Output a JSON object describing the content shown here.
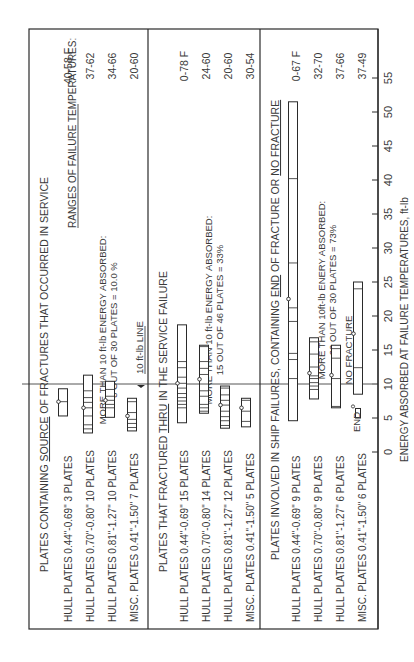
{
  "chart_data": {
    "type": "bar",
    "orientation": "rotated-90-ccw",
    "xlabel": "ENERGY ABSORBED AT FAILURE TEMPERATURES, ft-lb",
    "xlim": [
      0,
      55
    ],
    "xticks": [
      0,
      5,
      10,
      15,
      20,
      25,
      30,
      35,
      40,
      45,
      50,
      55
    ],
    "reference_line": {
      "value": 10,
      "label": "10 ft-lb LINE"
    },
    "ranges_header": "RANGES OF FAILURE TEMPERATURES:",
    "sections": [
      {
        "title_pre": "PLATES CONTAINING ",
        "title_em": "SOURCE",
        "title_post": " OF FRACTURES THAT OCCURRED IN SERVICE",
        "note_line1": "MORE THAN 10 ft-lb ENERGY ABSORBED:",
        "note_line2": "3 OUT OF 30 PLATES = 10.0 %",
        "rows": [
          {
            "label": "HULL PLATES 0.44\"-0.69\"  3 PLATES",
            "min": 5.3,
            "max": 9.3,
            "marker": 7.4,
            "ticks": [
              7.4
            ],
            "temp_range": "40-58 F"
          },
          {
            "label": "HULL PLATES 0.70\"-0.80\"  10 PLATES",
            "min": 2.8,
            "max": 11.3,
            "marker": 6.5,
            "ticks": [
              3.4,
              4.0,
              5.3,
              6.5,
              7.3,
              8.0,
              9.0
            ],
            "temp_range": "37-62"
          },
          {
            "label": "HULL PLATES 0.81\"-1.27\"  10 PLATES",
            "min": 5.1,
            "max": 10.4,
            "marker": 7.6,
            "ticks": [
              6.5,
              7.0,
              7.6,
              8.2,
              9.2
            ],
            "temp_range": "34-66"
          },
          {
            "label": "MISC. PLATES 0.41\"-1.50\"  7 PLATES",
            "min": 3.1,
            "max": 7.9,
            "marker": 5.3,
            "ticks": [
              3.6,
              4.2,
              4.8,
              5.8,
              7.4
            ],
            "temp_range": "20-60"
          }
        ]
      },
      {
        "title_pre": "PLATES THAT FRACTURED ",
        "title_em": "THRU",
        "title_post": " IN THE SERVICE FAILURE",
        "note_line1": "MORE THAN 10 ft-lb ENERGY ABSORBED:",
        "note_line2": "15 OUT OF 46 PLATES = 33%",
        "rows": [
          {
            "label": "HULL PLATES 0.44\"-0.69\"  15 PLATES",
            "min": 4.3,
            "max": 18.7,
            "marker": 10.1,
            "ticks": [
              6.5,
              7.0,
              7.5,
              8.0,
              8.6,
              9.4,
              10.1,
              11.0,
              12.4,
              13.3
            ],
            "temp_range": "0-78 F"
          },
          {
            "label": "HULL PLATES 0.70\"-0.80\"  14 PLATES",
            "min": 5.7,
            "max": 15.7,
            "marker": 10.7,
            "ticks": [
              6.0,
              6.5,
              7.0,
              8.2,
              9.0,
              10.0,
              11.4,
              12.3,
              13.3,
              15.5
            ],
            "temp_range": "24-60"
          },
          {
            "label": "HULL PLATES 0.81\"-1.27\"  12 PLATES",
            "min": 3.5,
            "max": 9.7,
            "marker": 6.9,
            "ticks": [
              3.9,
              4.6,
              5.2,
              6.0,
              6.9,
              7.6,
              8.4,
              9.4
            ],
            "temp_range": "20-60"
          },
          {
            "label": "MISC. PLATES 0.41\"-1.50\"  5 PLATES",
            "min": 3.7,
            "max": 7.9,
            "marker": 6.5,
            "ticks": [
              4.5,
              6.0,
              7.6
            ],
            "temp_range": "30-54"
          }
        ]
      },
      {
        "title_pre": "PLATES INVOLVED IN SHIP FAILURES, CONTAINING ",
        "title_em": "END",
        "title_post": " OF FRACTURE OR ",
        "title_em2": "NO FRACTURE",
        "note_line1": "MORE THAN 10ft-lb ENERY ABSORBED:",
        "note_line2": "22 OUT OF 30 PLATES = 73%",
        "no_fracture_label": "NO FRACTURE",
        "end_label": "END",
        "rows": [
          {
            "label": "HULL PLATES 0.44\"-0.69\"  9 PLATES",
            "min": 4.6,
            "max": 51.5,
            "marker": 22.5,
            "ticks": [
              10.8,
              13.6,
              14.5,
              19.2,
              21.2,
              27.8,
              40.2
            ],
            "temp_range": "0-67 F"
          },
          {
            "label": "HULL PLATES 0.70\"-0.80\"  9 PLATES",
            "min": 7.8,
            "max": 16.8,
            "marker": 11.6,
            "ticks": [
              9.2,
              9.7,
              10.2,
              10.8,
              11.2,
              12.5,
              14.4,
              16.2
            ],
            "temp_range": "32-70"
          },
          {
            "label": "HULL PLATES 0.81\"-1.27\"  6 PLATES",
            "min": 6.5,
            "max": 15.7,
            "marker": 11.3,
            "ticks": [
              6.7,
              10.8,
              13.8,
              15.2
            ],
            "temp_range": "37-66"
          },
          {
            "label": "MISC. PLATES 0.41\"-1.50\"  6 PLATES",
            "min": 8.5,
            "max": 25.0,
            "marker": 17.4,
            "ticks": [
              12.4,
              24.0
            ],
            "temp_range": "37-49",
            "end_min": 5.0,
            "end_max": 6.4,
            "end_marker": 6.7
          }
        ]
      }
    ]
  }
}
